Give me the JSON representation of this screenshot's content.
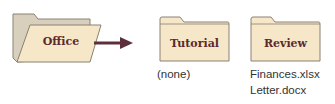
{
  "diagram": {
    "source_folder": {
      "label": "Office"
    },
    "subfolders": [
      {
        "label": "Tutorial",
        "contents": [
          "(none)"
        ]
      },
      {
        "label": "Review",
        "contents": [
          "Finances.xlsx",
          "Letter.docx"
        ]
      }
    ]
  },
  "colors": {
    "folder_fill": "#f6e7c8",
    "folder_back_fill": "#d9cfbd",
    "folder_stroke": "#8a8174",
    "label_text": "#5a2a2e",
    "arrow": "#5c2f3a",
    "file_text": "#333333"
  }
}
